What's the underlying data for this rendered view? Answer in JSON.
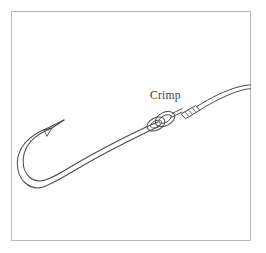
{
  "figure": {
    "type": "line-art-diagram",
    "background_color": "#ffffff",
    "frame": {
      "name": "border-frame",
      "color": "#b8b8b8",
      "stroke_width": 1,
      "x": 11,
      "y": 11,
      "width": 240,
      "height": 230
    },
    "ink_color": "#4a4a4a",
    "label": {
      "text": "Crimp",
      "x": 150,
      "y": 99,
      "font_size": 11.5,
      "color": "#3a3a3a"
    },
    "parts": [
      {
        "name": "hook-point",
        "label": "hook point",
        "description": "sharpened tip of the hook angled up and to the right"
      },
      {
        "name": "hook-barb",
        "label": "barb",
        "description": "rearward facing barb behind the point"
      },
      {
        "name": "hook-bend",
        "label": "bend",
        "description": "rounded curve of the hook"
      },
      {
        "name": "hook-shank",
        "label": "shank",
        "description": "long straight body of the hook rising to the right"
      },
      {
        "name": "hook-eye",
        "label": "eye",
        "description": "closed loop at the top of the shank"
      },
      {
        "name": "loop-knot",
        "label": "loop",
        "description": "leader loop passed through the hook eye"
      },
      {
        "name": "crimp-sleeve",
        "label": "crimp sleeve",
        "description": "metal sleeve squeezed onto the doubled leader",
        "ridge_count": 4
      },
      {
        "name": "leader-line",
        "label": "leader",
        "description": "monofilament leader curving off to the upper right edge"
      }
    ]
  }
}
